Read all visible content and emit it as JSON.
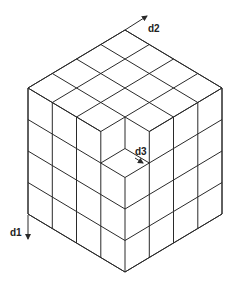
{
  "diagram": {
    "type": "isometric-cube-grid",
    "grid_size": [
      4,
      4,
      4
    ],
    "removed_cells": [
      [
        3,
        3,
        0
      ]
    ],
    "line_color": "#2a2a2a",
    "background": "#ffffff"
  },
  "axes": [
    {
      "id": "d1",
      "label": "d1",
      "direction": "down"
    },
    {
      "id": "d2",
      "label": "d2",
      "direction": "up-right"
    },
    {
      "id": "d3",
      "label": "d3",
      "direction": "down-right"
    }
  ]
}
